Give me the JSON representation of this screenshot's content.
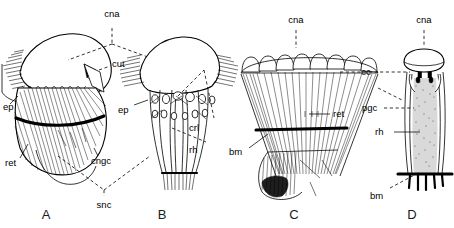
{
  "figure": {
    "background_color": "#ffffff",
    "ink_color": "#000000",
    "width": 454,
    "height": 228
  },
  "panels": [
    {
      "id": "A",
      "letter": "A",
      "caption": "A",
      "description": "Sagittal half view of ommatidium with corneal nipple array, cuticle, epidermis, retinula and cone-cell region"
    },
    {
      "id": "B",
      "letter": "B",
      "caption": "B",
      "description": "Frontal view of ommatidium showing crystalline cone cells, pigment granules and rhabdom"
    },
    {
      "id": "C",
      "letter": "C",
      "caption": "C",
      "description": "Longitudinal section through fan of retinula cells with corneal cones and basement membrane"
    },
    {
      "id": "D",
      "letter": "D",
      "caption": "D",
      "description": "Single ommatidium showing crystalline cone, primary pigment cells, rhabdom and basement membrane"
    }
  ],
  "labels": {
    "cna_a": "cna",
    "cut": "cut",
    "ep_a": "ep",
    "ret_a": "ret",
    "cngc": "cngc",
    "snc": "snc",
    "ep_b": "ep",
    "crl": "crl",
    "rh_b": "rh",
    "cna_c": "cna",
    "cc": "cc",
    "ret_c": "ret",
    "bm_c": "bm",
    "cna_d": "cna",
    "pgc": "pgc",
    "rh_d": "rh",
    "bm_d": "bm"
  },
  "abbreviations": [
    {
      "key": "cna",
      "label": "cna"
    },
    {
      "key": "cut",
      "label": "cut"
    },
    {
      "key": "ep",
      "label": "ep"
    },
    {
      "key": "ret",
      "label": "ret"
    },
    {
      "key": "cngc",
      "label": "cngc"
    },
    {
      "key": "snc",
      "label": "snc"
    },
    {
      "key": "crl",
      "label": "crl"
    },
    {
      "key": "rh",
      "label": "rh"
    },
    {
      "key": "cc",
      "label": "cc"
    },
    {
      "key": "pgc",
      "label": "pgc"
    },
    {
      "key": "bm",
      "label": "bm"
    }
  ]
}
